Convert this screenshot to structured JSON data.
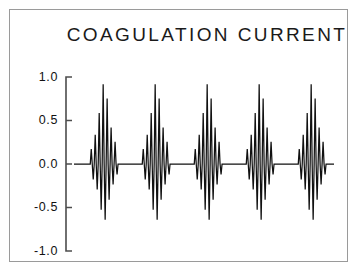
{
  "figure": {
    "background_color": "#ffffff",
    "border_color": "#9a9a9a",
    "trace_color": "#111111",
    "axis_color": "#4d4d4d"
  },
  "chart_data": {
    "type": "line",
    "title": "COAGULATION CURRENT",
    "xlabel": "",
    "ylabel": "",
    "grid": false,
    "legend": "none",
    "xlim": [
      0,
      1
    ],
    "ylim": [
      -1.0,
      1.0
    ],
    "yticks": [
      1.0,
      0.5,
      0.0,
      -0.5,
      -1.0
    ],
    "ytick_labels": [
      "1.0",
      "0.5",
      "0.0",
      "-0.5",
      "-1.0"
    ],
    "xticks": [],
    "xtick_labels": [],
    "series": [
      {
        "name": "coagulation current",
        "burst_count": 5,
        "burst_period": 0.2,
        "burst_first_center": 0.115,
        "carrier_cycles_per_burst": 7,
        "peak_positive": 1.0,
        "peak_negative": -0.7,
        "baseline": 0.0,
        "duty_fraction": 0.33,
        "burst_envelope": [
          0.13,
          0.42,
          1.0,
          0.42,
          0.13
        ],
        "points_note": "waveform generated as damped sinusoidal bursts separated by flat zero baseline"
      }
    ]
  }
}
